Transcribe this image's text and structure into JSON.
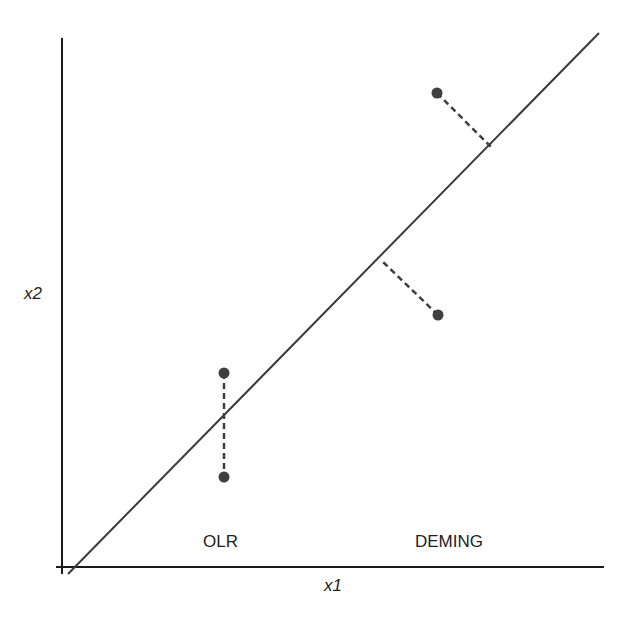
{
  "diagram": {
    "axes": {
      "x_label": "x1",
      "y_label": "x2"
    },
    "regions": {
      "left_label": "OLR",
      "right_label": "DEMING"
    },
    "colors": {
      "line": "#3a3a3a",
      "point": "#3f3f3f",
      "axis": "#1a1a1a"
    },
    "fit_line": {
      "x1": 68,
      "y1": 574,
      "x2": 599,
      "y2": 33
    },
    "olr_residual": {
      "top_point": {
        "x": 224,
        "y": 373
      },
      "bottom_point": {
        "x": 224,
        "y": 477
      }
    },
    "deming_residuals": [
      {
        "point": {
          "x": 438,
          "y": 315
        },
        "foot": {
          "x": 383,
          "y": 262
        }
      },
      {
        "point": {
          "x": 437,
          "y": 93
        },
        "foot": {
          "x": 491,
          "y": 147
        }
      }
    ]
  }
}
